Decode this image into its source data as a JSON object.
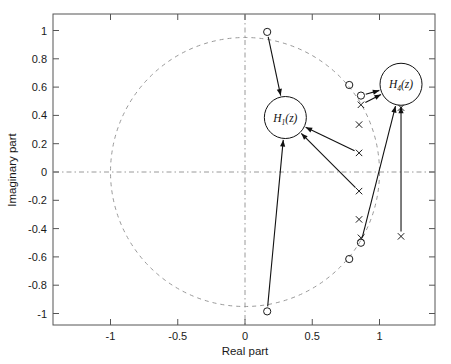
{
  "chart_data": {
    "type": "scatter",
    "title": "",
    "xlabel": "Real part",
    "ylabel": "Imaginary part",
    "xlim": [
      -1.38,
      1.38
    ],
    "ylim": [
      -1.12,
      1.12
    ],
    "xticks": [
      "-1",
      "-0.5",
      "0",
      "0.5",
      "1"
    ],
    "xtick_values": [
      -1,
      -0.5,
      0,
      0.5,
      1
    ],
    "yticks": [
      "1",
      "0.8",
      "0.6",
      "0.4",
      "0.2",
      "0",
      "-0.2",
      "-0.4",
      "-0.6",
      "-0.8",
      "-1"
    ],
    "ytick_values": [
      1,
      0.8,
      0.6,
      0.4,
      0.2,
      0,
      -0.2,
      -0.4,
      -0.6,
      -0.8,
      -1
    ],
    "grid": false,
    "legend": "none",
    "reference_shapes": [
      {
        "name": "unit-circle",
        "type": "circle",
        "cx": 0,
        "cy": 0,
        "r": 1,
        "style": "dashed"
      },
      {
        "name": "real-axis",
        "type": "hline",
        "y": 0,
        "style": "dash-dot"
      },
      {
        "name": "imag-axis",
        "type": "vline",
        "x": 0,
        "style": "dash-dot"
      }
    ],
    "series": [
      {
        "name": "zeros",
        "marker": "o",
        "points": [
          {
            "x": 0.165,
            "y": 0.99
          },
          {
            "x": 0.165,
            "y": -0.985
          },
          {
            "x": 0.775,
            "y": 0.615
          },
          {
            "x": 0.862,
            "y": 0.54
          },
          {
            "x": 0.862,
            "y": -0.5
          },
          {
            "x": 0.775,
            "y": -0.615
          }
        ]
      },
      {
        "name": "poles",
        "marker": "x",
        "points": [
          {
            "x": 0.862,
            "y": 0.475
          },
          {
            "x": 0.848,
            "y": 0.335
          },
          {
            "x": 0.848,
            "y": 0.135
          },
          {
            "x": 0.848,
            "y": -0.135
          },
          {
            "x": 0.848,
            "y": -0.335
          },
          {
            "x": 0.862,
            "y": -0.465
          },
          {
            "x": 1.16,
            "y": 0.455
          },
          {
            "x": 1.16,
            "y": -0.455
          }
        ]
      }
    ],
    "annotations": [
      {
        "name": "H1-callout",
        "label": "H",
        "subscript": "1",
        "suffix": "(z)",
        "cx": 0.3,
        "cy": 0.385,
        "r_px": 21,
        "arrows_from": [
          {
            "x": 0.165,
            "y": 0.99
          },
          {
            "x": 0.848,
            "y": 0.135
          },
          {
            "x": 0.848,
            "y": -0.135
          },
          {
            "x": 0.165,
            "y": -0.985
          }
        ]
      },
      {
        "name": "H4-callout",
        "label": "H",
        "subscript": "4",
        "suffix": "(z)",
        "cx": 1.16,
        "cy": 0.62,
        "r_px": 21,
        "arrows_from": [
          {
            "x": 0.862,
            "y": 0.54
          },
          {
            "x": 0.862,
            "y": 0.475
          },
          {
            "x": 1.16,
            "y": -0.455
          },
          {
            "x": 0.862,
            "y": -0.5
          }
        ]
      }
    ],
    "colors": {
      "axis": "#4d4d4d",
      "marker": "#1a1a1a",
      "reference": "#9a9a9a",
      "arrow": "#111111",
      "background": "#ffffff"
    }
  },
  "axes": {
    "x_title": "Real part",
    "y_title": "Imaginary part"
  },
  "annotations": {
    "h1": {
      "base": "H",
      "sub": "1",
      "tail": "(z)"
    },
    "h4": {
      "base": "H",
      "sub": "4",
      "tail": "(z)"
    }
  }
}
